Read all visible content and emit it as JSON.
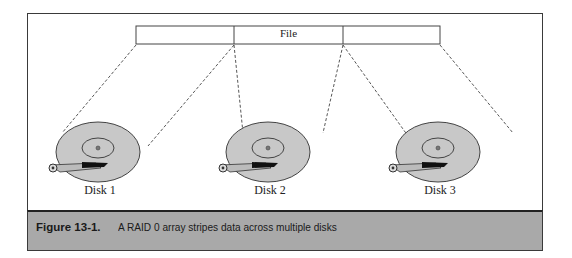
{
  "figure": {
    "file_label": "File",
    "file_segments": 3,
    "disks": [
      {
        "label": "Disk 1"
      },
      {
        "label": "Disk 2"
      },
      {
        "label": "Disk 3"
      }
    ],
    "caption": {
      "number": "Figure 13-1.",
      "text": "A RAID 0 array stripes data across multiple disks"
    },
    "colors": {
      "platter": "#c8c8c8",
      "caption_bg": "#a9a9a9",
      "frame": "#3a3a3a"
    }
  }
}
